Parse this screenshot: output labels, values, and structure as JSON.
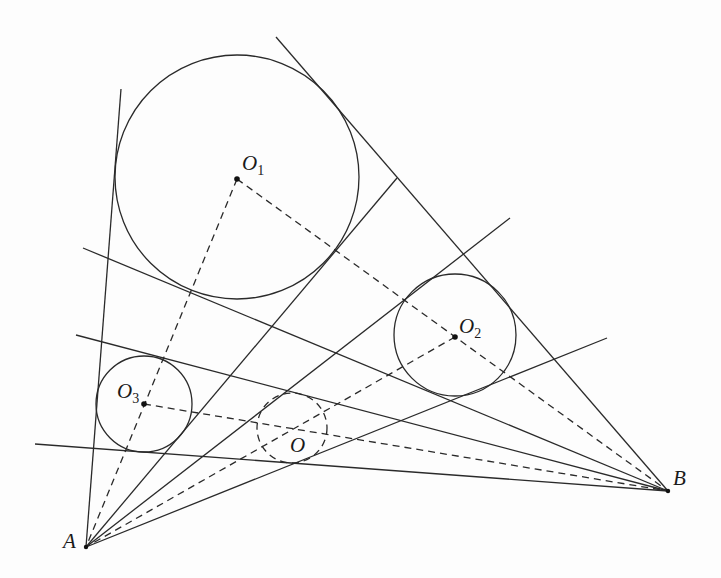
{
  "figure": {
    "points": {
      "A": {
        "label": "A",
        "x": 86,
        "y": 547
      },
      "B": {
        "label": "B",
        "x": 668,
        "y": 491
      },
      "O1": {
        "label": "O",
        "sub": "1",
        "x": 237,
        "y": 179
      },
      "O2": {
        "label": "O",
        "sub": "2",
        "x": 455,
        "y": 337
      },
      "O3": {
        "label": "O",
        "sub": "3",
        "x": 144,
        "y": 404
      },
      "O": {
        "label": "O",
        "x": 296,
        "y": 426
      }
    },
    "circles": [
      {
        "name": "circle-o1",
        "cx": 237,
        "cy": 177,
        "r": 122,
        "style": "solid"
      },
      {
        "name": "circle-o2",
        "cx": 455,
        "cy": 335,
        "r": 61,
        "style": "solid"
      },
      {
        "name": "circle-o3",
        "cx": 144,
        "cy": 404,
        "r": 48,
        "style": "solid"
      },
      {
        "name": "circle-o",
        "cx": 292,
        "cy": 428,
        "r": 35,
        "style": "dashed"
      }
    ]
  }
}
